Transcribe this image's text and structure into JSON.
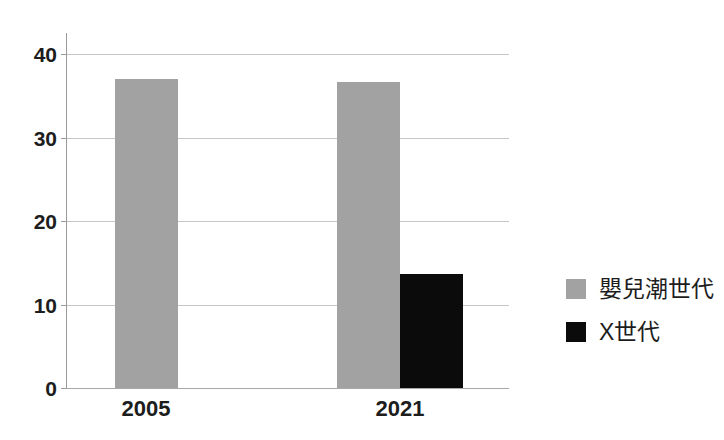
{
  "chart_data": {
    "type": "bar",
    "categories": [
      "2005",
      "2021"
    ],
    "series": [
      {
        "name": "嬰兒潮世代",
        "color": "#a2a2a2",
        "values": [
          37,
          36.6
        ]
      },
      {
        "name": "X世代",
        "color": "#0b0b0b",
        "values": [
          null,
          13.7
        ]
      }
    ],
    "title": "",
    "xlabel": "",
    "ylabel": "",
    "ylim": [
      0,
      40
    ],
    "yticks": [
      0,
      10,
      20,
      30,
      40
    ],
    "grid": true,
    "legend_position": "right"
  },
  "colors": {
    "background": "#ffffff",
    "axis": "#9a9a9a",
    "gridline": "#c6c6c6",
    "text": "#1d1d1d"
  }
}
